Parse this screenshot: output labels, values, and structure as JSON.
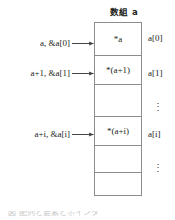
{
  "diagram": {
    "title": "数組 a",
    "kind": "c-pointer-array-memory-layout",
    "cells": [
      {
        "text": "*a",
        "index_label": "a[0]",
        "pointer_label": "a, &a[0]",
        "has_arrow": true,
        "is_gap": false
      },
      {
        "text": "*(a+1)",
        "index_label": "a[1]",
        "pointer_label": "a+1, &a[1]",
        "has_arrow": true,
        "is_gap": false
      },
      {
        "text": "",
        "index_label": "⋮",
        "pointer_label": "",
        "has_arrow": false,
        "is_gap": true
      },
      {
        "text": "*(a+i)",
        "index_label": "a[i]",
        "pointer_label": "a+i, &a[i]",
        "has_arrow": true,
        "is_gap": false
      },
      {
        "text": "",
        "index_label": "⋮",
        "pointer_label": "",
        "has_arrow": false,
        "is_gap": true
      },
      {
        "text": "",
        "index_label": "",
        "pointer_label": "",
        "has_arrow": false,
        "is_gap": true
      }
    ],
    "caption_partial": "図    配列と要素とポインタ",
    "colors": {
      "border": "#8c8c8c",
      "text": "#231f20",
      "arrow": "#444444",
      "background": "#ffffff"
    }
  }
}
